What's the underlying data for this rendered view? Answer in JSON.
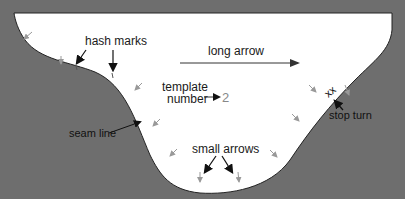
{
  "colors": {
    "background": "#6e6e6e",
    "template_fill": "#ffffff",
    "seam_line": "#333333",
    "small_arrow": "#999999",
    "label": "#1a1a1a"
  },
  "labels": {
    "hash_marks": "hash marks",
    "long_arrow": "long arrow",
    "template": "template",
    "number": "number",
    "template_number_value": "2",
    "seam_line": "seam line",
    "small_arrows": "small arrows",
    "stop_turn": "stop turn",
    "stop_turn_mark": "xx"
  }
}
